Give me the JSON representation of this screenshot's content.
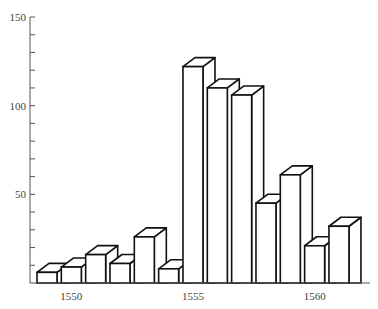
{
  "chart_data": {
    "type": "bar",
    "style": "3d-outline",
    "title": "",
    "xlabel": "",
    "ylabel": "",
    "categories": [
      "1549",
      "1550",
      "1551",
      "1552",
      "1553",
      "1554",
      "1555",
      "1556",
      "1557",
      "1558",
      "1559",
      "1560",
      "1561"
    ],
    "values": [
      6,
      9,
      16,
      11,
      26,
      8,
      122,
      110,
      106,
      45,
      61,
      21,
      32
    ],
    "ylim": [
      0,
      150
    ],
    "y_ticks_major": [
      50,
      100,
      150
    ],
    "y_ticks_minor_step": 10,
    "x_tick_labels": [
      {
        "label": "1550",
        "index": 1
      },
      {
        "label": "1555",
        "index": 6
      },
      {
        "label": "1560",
        "index": 11
      }
    ],
    "grid": false,
    "legend": null
  },
  "axis": {
    "y_labels": [
      "150",
      "100",
      "50"
    ],
    "x_labels": [
      "1550",
      "1555",
      "1560"
    ]
  },
  "colors": {
    "bar_fill": "#ffffff",
    "bar_stroke": "#111111",
    "axis": "#555555",
    "text": "#444444"
  }
}
